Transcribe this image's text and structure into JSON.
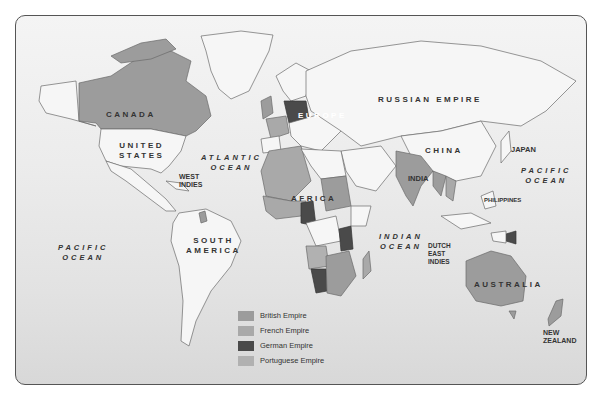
{
  "map": {
    "title": "World Colonial Empires",
    "regions": {
      "canada": "CANADA",
      "united_states": "UNITED\nSTATES",
      "west_indies": "WEST\nINDIES",
      "south_america": "SOUTH\nAMERICA",
      "europe": "EUROPE",
      "russian_empire": "RUSSIAN EMPIRE",
      "africa": "AFRICA",
      "china": "CHINA",
      "india": "INDIA",
      "japan": "JAPAN",
      "philippines": "PHILIPPINES",
      "dutch_east_indies": "DUTCH\nEAST\nINDIES",
      "australia": "AUSTRALIA",
      "new_zealand": "NEW\nZEALAND"
    },
    "oceans": {
      "atlantic": "ATLANTIC\nOCEAN",
      "pacific_west": "PACIFIC\nOCEAN",
      "pacific_east": "PACIFIC\nOCEAN",
      "indian": "INDIAN\nOCEAN"
    }
  },
  "legend": {
    "items": [
      {
        "label": "British Empire",
        "color": "#9c9c9c"
      },
      {
        "label": "French Empire",
        "color": "#a9a9a9"
      },
      {
        "label": "German Empire",
        "color": "#4a4a4a"
      },
      {
        "label": "Portuguese Empire",
        "color": "#b1b1b1"
      }
    ]
  }
}
